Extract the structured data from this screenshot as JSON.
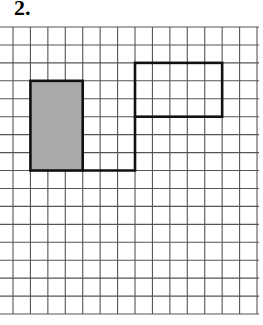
{
  "problem": {
    "number_label": "2."
  },
  "grid": {
    "origin_x": 13,
    "origin_y": 27,
    "cell_w": 17.43,
    "cell_h": 17.94,
    "cols": 14,
    "rows": 16,
    "h_line_x_start": 0,
    "h_line_x_end": 259,
    "line_color": "#555555"
  },
  "shapes": {
    "shaded_rectangle": {
      "col": 1,
      "row": 3,
      "width_cells": 3,
      "height_cells": 5,
      "fill": "#a9a9a9",
      "stroke": "#111111"
    },
    "outlined_rectangle": {
      "col": 7,
      "row": 2,
      "width_cells": 5,
      "height_cells": 3,
      "fill": "none",
      "stroke": "#111111"
    },
    "connector_path": {
      "points": [
        [
          4,
          8
        ],
        [
          7,
          8
        ],
        [
          7,
          5
        ]
      ],
      "stroke": "#111111"
    }
  }
}
